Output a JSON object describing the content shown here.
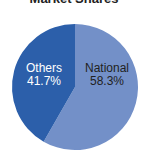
{
  "chart_data": {
    "type": "pie",
    "title": "Market Shares",
    "categories": [
      "National",
      "Others"
    ],
    "values": [
      58.3,
      41.7
    ],
    "labels": [
      "National\n58.3%",
      "Others\n41.7%"
    ],
    "colors": [
      "#7390c8",
      "#2c5faa"
    ],
    "legend": "none",
    "start_angle": "12 o'clock, clockwise"
  },
  "slices": [
    {
      "name": "National",
      "pct": "58.3%",
      "color": "#7390c8"
    },
    {
      "name": "Others",
      "pct": "41.7%",
      "color": "#2c5faa"
    }
  ]
}
